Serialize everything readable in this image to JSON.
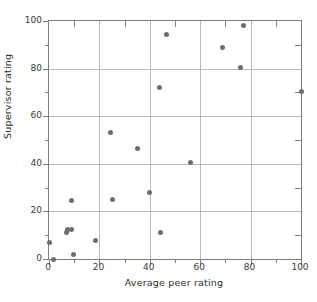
{
  "chart_data": {
    "type": "scatter",
    "title": "",
    "xlabel": "Average peer rating",
    "ylabel": "Supervisor rating",
    "xlim": [
      0,
      100
    ],
    "ylim": [
      0,
      100
    ],
    "grid": true,
    "legend": null,
    "marker": {
      "shape": "circle",
      "color": "#6e6e6e",
      "size": 5
    },
    "axis_color": "#7d7d7d",
    "grid_color": "#b9b9b9",
    "background": "#ffffff",
    "xticks": [
      0,
      20,
      40,
      60,
      80,
      100
    ],
    "yticks": [
      0,
      20,
      40,
      60,
      80,
      100
    ],
    "xticks_minor": [
      10,
      30,
      50,
      70,
      90
    ],
    "yticks_minor": [
      10,
      30,
      50,
      70,
      90
    ],
    "xtick_labels": [
      "0",
      "20",
      "40",
      "60",
      "80",
      "100"
    ],
    "ytick_labels": [
      "0",
      "20",
      "40",
      "60",
      "80",
      "100"
    ],
    "points": [
      {
        "x": 0.0,
        "y": 7.0
      },
      {
        "x": 1.8,
        "y": 0.0
      },
      {
        "x": 7.0,
        "y": 11.3
      },
      {
        "x": 7.3,
        "y": 12.5
      },
      {
        "x": 8.8,
        "y": 12.6
      },
      {
        "x": 9.0,
        "y": 24.5
      },
      {
        "x": 9.7,
        "y": 2.0
      },
      {
        "x": 18.6,
        "y": 7.7
      },
      {
        "x": 24.5,
        "y": 53.0
      },
      {
        "x": 25.0,
        "y": 25.0
      },
      {
        "x": 35.3,
        "y": 46.4
      },
      {
        "x": 40.0,
        "y": 28.0
      },
      {
        "x": 44.0,
        "y": 72.0
      },
      {
        "x": 44.3,
        "y": 11.2
      },
      {
        "x": 46.8,
        "y": 94.5
      },
      {
        "x": 56.0,
        "y": 40.5
      },
      {
        "x": 68.8,
        "y": 89.0
      },
      {
        "x": 76.0,
        "y": 80.5
      },
      {
        "x": 77.0,
        "y": 98.0
      },
      {
        "x": 100.0,
        "y": 70.5
      }
    ]
  },
  "figure": {
    "name": "scatter-plot-supervisor-vs-peer-rating"
  }
}
